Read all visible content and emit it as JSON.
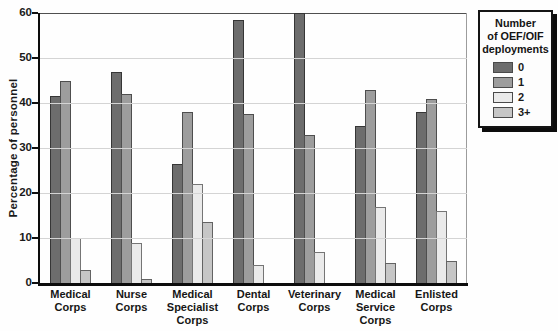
{
  "chart_data": {
    "type": "bar",
    "title": "",
    "ylabel": "Percentage of personnel",
    "xlabel": "",
    "ylim": [
      0,
      60
    ],
    "yticks": [
      0,
      10,
      20,
      30,
      40,
      50,
      60
    ],
    "grid": true,
    "categories": [
      "Medical Corps",
      "Nurse Corps",
      "Medical Specialist Corps",
      "Dental Corps",
      "Veterinary Corps",
      "Medical Service Corps",
      "Enlisted Corps"
    ],
    "legend": {
      "position": "right",
      "title_lines": [
        "Number",
        "of OEF/OIF",
        "deployments"
      ]
    },
    "series": [
      {
        "name": "0",
        "color": "#6d6d6d",
        "values": [
          41.5,
          47,
          26.5,
          58.5,
          60,
          35,
          38
        ]
      },
      {
        "name": "1",
        "color": "#9d9d9d",
        "values": [
          45,
          42,
          38,
          37.5,
          33,
          43,
          41
        ]
      },
      {
        "name": "2",
        "color": "#eaeaea",
        "values": [
          10,
          9,
          22,
          4,
          7,
          17,
          16
        ]
      },
      {
        "name": "3+",
        "color": "#c6c6c6",
        "values": [
          3,
          1,
          13.5,
          0,
          0,
          4.5,
          5
        ]
      }
    ]
  }
}
